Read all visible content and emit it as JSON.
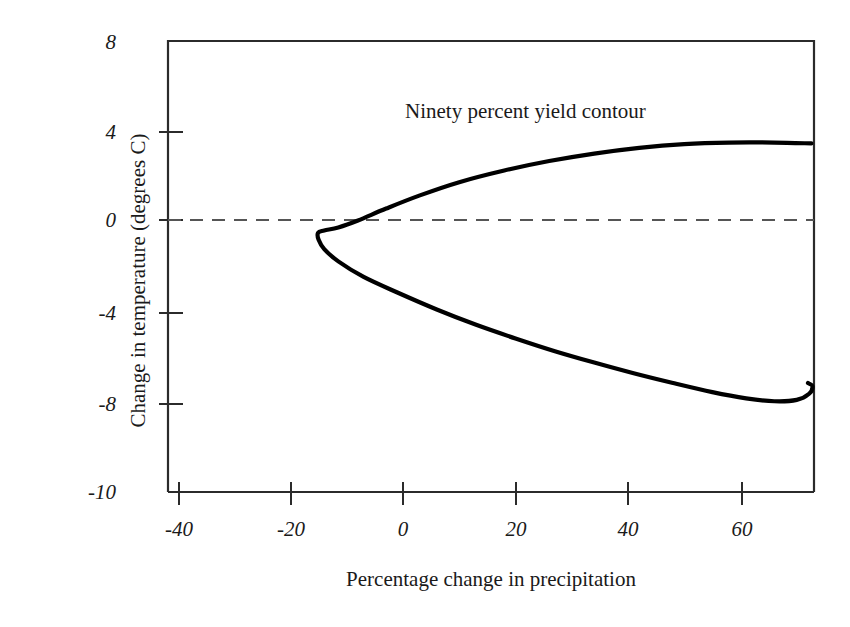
{
  "chart_data": {
    "type": "line",
    "title": "",
    "xlabel": "Percentage change in precipitation",
    "ylabel": "Change in temperature (degrees C)",
    "xlim": [
      -42,
      72.6
    ],
    "ylim": [
      -10,
      8
    ],
    "grid": false,
    "legend": "none",
    "xticks": [
      -40,
      -20,
      0,
      20,
      40,
      60
    ],
    "xtick_labels": [
      "-40",
      "-20",
      "0",
      "20",
      "40",
      "60"
    ],
    "yticks": [
      8,
      4,
      0,
      -4,
      -8,
      -10
    ],
    "ytick_labels": [
      "8",
      "4",
      "0",
      "-4",
      "-8",
      "-10"
    ],
    "annotations": [
      {
        "name": "contour-annotation",
        "text": "Ninety percent yield contour",
        "x": 18,
        "y": 4.7
      }
    ],
    "reference_lines": [
      {
        "name": "zero-temperature-line",
        "orientation": "horizontal",
        "value": 0,
        "style": "dashed",
        "color": "#555555"
      }
    ],
    "series": [
      {
        "name": "Ninety percent yield contour",
        "color": "#000000",
        "linewidth": 4.2,
        "description": "Open parabola-like contour opening to the right; left vertex near (-15, -0.5); upper branch rises to a plateau near +3.5 degrees C; lower branch descends to a minimum near -7.9 degrees C around 63% precipitation, then hooks back up to about -7.1 at the right edge.",
        "points": [
          {
            "x": 72.6,
            "y": 3.48
          },
          {
            "x": 66.0,
            "y": 3.52
          },
          {
            "x": 58.0,
            "y": 3.52
          },
          {
            "x": 50.0,
            "y": 3.45
          },
          {
            "x": 42.0,
            "y": 3.28
          },
          {
            "x": 34.0,
            "y": 3.02
          },
          {
            "x": 26.0,
            "y": 2.68
          },
          {
            "x": 18.0,
            "y": 2.25
          },
          {
            "x": 10.0,
            "y": 1.72
          },
          {
            "x": 3.0,
            "y": 1.12
          },
          {
            "x": -3.0,
            "y": 0.52
          },
          {
            "x": -8.0,
            "y": -0.02
          },
          {
            "x": -11.5,
            "y": -0.32
          },
          {
            "x": -14.0,
            "y": -0.45
          },
          {
            "x": -15.1,
            "y": -0.55
          },
          {
            "x": -15.0,
            "y": -0.85
          },
          {
            "x": -14.0,
            "y": -1.25
          },
          {
            "x": -11.5,
            "y": -1.78
          },
          {
            "x": -7.0,
            "y": -2.45
          },
          {
            "x": -1.0,
            "y": -3.12
          },
          {
            "x": 6.0,
            "y": -3.85
          },
          {
            "x": 13.0,
            "y": -4.52
          },
          {
            "x": 20.0,
            "y": -5.12
          },
          {
            "x": 27.0,
            "y": -5.68
          },
          {
            "x": 34.0,
            "y": -6.18
          },
          {
            "x": 41.0,
            "y": -6.65
          },
          {
            "x": 48.0,
            "y": -7.08
          },
          {
            "x": 55.0,
            "y": -7.48
          },
          {
            "x": 61.0,
            "y": -7.75
          },
          {
            "x": 66.0,
            "y": -7.88
          },
          {
            "x": 70.0,
            "y": -7.82
          },
          {
            "x": 72.2,
            "y": -7.55
          },
          {
            "x": 72.8,
            "y": -7.22
          },
          {
            "x": 72.0,
            "y": -7.08
          }
        ]
      }
    ]
  }
}
